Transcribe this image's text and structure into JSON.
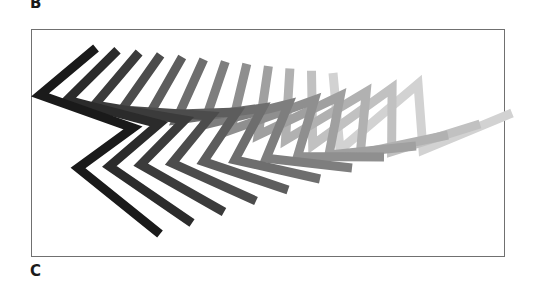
{
  "panels": {
    "top_label": "B",
    "bottom_label": "C"
  },
  "figure": {
    "shape_count": 12,
    "stroke_width": 9,
    "start_shape": [
      [
        96,
        48
      ],
      [
        40,
        95
      ],
      [
        133,
        128
      ],
      [
        78,
        168
      ],
      [
        160,
        234
      ]
    ],
    "end_shape": [
      [
        333,
        73
      ],
      [
        340,
        150
      ],
      [
        418,
        84
      ],
      [
        423,
        150
      ],
      [
        512,
        113
      ]
    ],
    "color_start": "#1a1a1a",
    "color_end": "#d2d2d2",
    "frame_color": "#707070"
  }
}
